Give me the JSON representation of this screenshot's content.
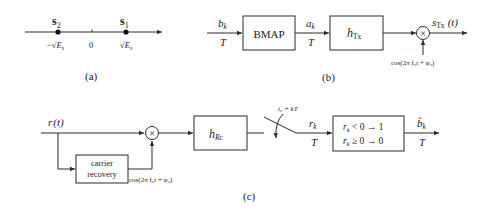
{
  "panel_a": {
    "caption": "(a)",
    "points": [
      {
        "symbol": "s",
        "sub": "2",
        "tick_label": "−√E_s",
        "tick_prefix": "−√",
        "tick_var": "E",
        "tick_sub": "s"
      },
      {
        "symbol": "s",
        "sub": "1",
        "tick_label": "√E_s",
        "tick_prefix": "√",
        "tick_var": "E",
        "tick_sub": "s"
      }
    ],
    "origin_label": "0"
  },
  "panel_b": {
    "caption": "(b)",
    "input_label": {
      "var": "b",
      "sub": "k",
      "rate": "T"
    },
    "bmap_label": "BMAP",
    "mid_label": {
      "var": "a",
      "sub": "k",
      "rate": "T"
    },
    "filter_label": {
      "var": "h",
      "sub": "Tx"
    },
    "multiplier_symbol": "×",
    "output_label": {
      "var": "s",
      "sub": "Tx",
      "arg": "(t)"
    },
    "carrier_label": "cos(2π f₀t + φ₀)"
  },
  "panel_c": {
    "caption": "(c)",
    "input_label": {
      "var": "r",
      "arg": "(t)"
    },
    "multiplier_symbol": "×",
    "carrier_recovery_line1": "carrier",
    "carrier_recovery_line2": "recovery",
    "carrier_label": "cos(2π f₀t + φ₀)",
    "filter_label": {
      "var": "h",
      "sub": "Rc"
    },
    "sampler_label": "t₀ + kT",
    "sample_label": {
      "var": "r",
      "sub": "k",
      "rate": "T"
    },
    "decision_line1": "r_k < 0 → 1",
    "decision_line1_var": "r",
    "decision_line1_sub": "k",
    "decision_line1_rest": " < 0 → 1",
    "decision_line2_var": "r",
    "decision_line2_sub": "k",
    "decision_line2_rest": " ≥ 0 → 0",
    "output_label": {
      "var": "b̂",
      "sub": "k",
      "rate": "T"
    }
  }
}
